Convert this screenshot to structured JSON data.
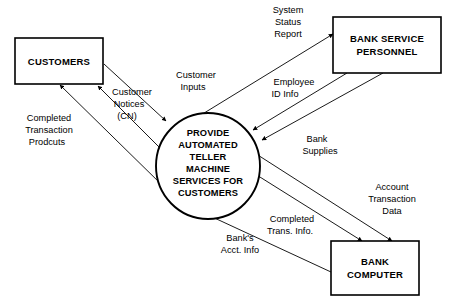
{
  "diagram": {
    "type": "data-flow-diagram",
    "title": "",
    "process": {
      "id": "provide-atm-services",
      "shape": "circle",
      "lines": [
        "PROVIDE",
        "AUTOMATED",
        "TELLER",
        "MACHINE",
        "SERVICES FOR",
        "CUSTOMERS"
      ]
    },
    "entities": [
      {
        "id": "customers",
        "shape": "rectangle",
        "lines": [
          "CUSTOMERS"
        ]
      },
      {
        "id": "bank-service-personnel",
        "shape": "rectangle",
        "lines": [
          "BANK SERVICE",
          "PERSONNEL"
        ]
      },
      {
        "id": "bank-computer",
        "shape": "rectangle",
        "lines": [
          "BANK",
          "COMPUTER"
        ]
      }
    ],
    "flows": [
      {
        "id": "customer-inputs",
        "from": "customers",
        "to": "provide-atm-services",
        "lines": [
          "Customer",
          "Inputs"
        ]
      },
      {
        "id": "customer-notices",
        "from": "provide-atm-services",
        "to": "customers",
        "lines": [
          "Customer",
          "Notices",
          "(CN)"
        ]
      },
      {
        "id": "completed-transaction-products",
        "from": "provide-atm-services",
        "to": "customers",
        "lines": [
          "Completed",
          "Transaction",
          "Prodcuts"
        ]
      },
      {
        "id": "system-status-report",
        "from": "provide-atm-services",
        "to": "bank-service-personnel",
        "lines": [
          "System",
          "Status",
          "Report"
        ]
      },
      {
        "id": "employee-id-info",
        "from": "bank-service-personnel",
        "to": "provide-atm-services",
        "lines": [
          "Employee",
          "ID Info"
        ]
      },
      {
        "id": "bank-supplies",
        "from": "bank-service-personnel",
        "to": "provide-atm-services",
        "lines": [
          "Bank",
          "Supplies"
        ]
      },
      {
        "id": "account-transaction-data",
        "from": "provide-atm-services",
        "to": "bank-computer",
        "lines": [
          "Account",
          "Transaction",
          "Data"
        ]
      },
      {
        "id": "completed-trans-info",
        "from": "provide-atm-services",
        "to": "bank-computer",
        "lines": [
          "Completed",
          "Trans. Info."
        ]
      },
      {
        "id": "banks-acct-info",
        "from": "bank-computer",
        "to": "provide-atm-services",
        "lines": [
          "Bank's",
          "Acct. Info"
        ]
      }
    ],
    "colors": {
      "stroke": "#000000",
      "fill": "#ffffff",
      "text": "#000000"
    }
  }
}
